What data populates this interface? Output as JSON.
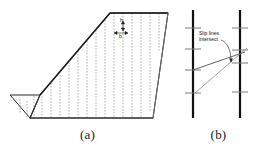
{
  "figure": {
    "width": 262,
    "height": 145,
    "background": "#ffffff",
    "line_color": "#2b2b2b",
    "slice_color": "#8a8a8a",
    "bold_color": "#1a1a1a"
  },
  "panel_a": {
    "caption": "(a)",
    "description": "Slope cross-section divided into vertical slices",
    "slice_count": 14,
    "labels": {
      "width": "b",
      "height": "h"
    },
    "geometry": {
      "toe_apex": [
        12,
        95
      ],
      "toe_ledge_right": [
        40,
        95
      ],
      "crest_left": [
        40,
        95
      ],
      "crest_top": [
        110,
        13
      ],
      "top_right": [
        168,
        13
      ],
      "base_right": [
        155,
        118
      ],
      "base_left": [
        32,
        118
      ]
    }
  },
  "panel_b": {
    "caption": "(b)",
    "description": "Two vertical slice boundaries with converging slip lines",
    "annotation": {
      "line1": "Slip lines",
      "line2": "intersect"
    },
    "left_boundary_ticks": 4,
    "right_boundary_ticks": 4,
    "slip_lines": 2,
    "intersection_marked": true
  }
}
